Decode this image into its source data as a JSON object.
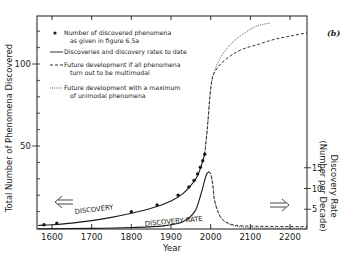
{
  "chart_data": {
    "type": "line",
    "panel_label": "(b)",
    "xlabel": "Year",
    "ylabel_left": "Total Number of Phenomena Discovered",
    "ylabel_right_line1": "Discovery Rate",
    "ylabel_right_line2": "(Number per Decade)",
    "xlim": [
      1565,
      2245
    ],
    "ylim_left": [
      0,
      125
    ],
    "ylim_right": [
      0,
      30
    ],
    "x_ticks": [
      1600,
      1700,
      1800,
      1900,
      2000,
      2100,
      2200
    ],
    "y_left_ticks_labeled": [
      50,
      100
    ],
    "y_left_minor_step": 10,
    "y_right_ticks_labeled": [
      5,
      10,
      15
    ],
    "grid": false,
    "legend_position": "upper-left",
    "legend": [
      {
        "marker": "dot",
        "line1": "Number of discovered phenomena",
        "line2": "as given in figure 6.5a"
      },
      {
        "marker": "solid",
        "line1": "Discoveries and discovery rates to date",
        "line2": ""
      },
      {
        "marker": "dashed",
        "line1": "Future development if all phenomena",
        "line2": "turn out to be multimodal"
      },
      {
        "marker": "dotted",
        "line1": "Future development with a maximum",
        "line2": "of unimodal phenomena"
      }
    ],
    "annotations": [
      {
        "text": "DISCOVERY",
        "x": 1680,
        "y": 10,
        "rotate": -6
      },
      {
        "text": "DISCOVERY RATE",
        "x": 1870,
        "y_rate": 1.2,
        "rotate": -4
      },
      {
        "text": "⇐",
        "x": 1620,
        "y": 17
      },
      {
        "text": "⇒",
        "x": 2160,
        "y_rate": 8
      }
    ],
    "series": [
      {
        "name": "Number of discovered phenomena",
        "style": "points",
        "axis": "left",
        "x": [
          1580,
          1612,
          1800,
          1865,
          1918,
          1945,
          1958,
          1967,
          1974,
          1980,
          1985
        ],
        "y": [
          2,
          3,
          10,
          14,
          20,
          25,
          29,
          33,
          37,
          41,
          45
        ]
      },
      {
        "name": "Discoveries to date (cumulative)",
        "style": "solid",
        "axis": "left",
        "x": [
          1565,
          1600,
          1650,
          1700,
          1750,
          1800,
          1850,
          1900,
          1930,
          1950,
          1965,
          1975,
          1985
        ],
        "y": [
          1.5,
          2,
          3,
          4.5,
          6.5,
          9,
          12,
          16.5,
          21,
          26,
          31,
          37,
          45
        ]
      },
      {
        "name": "Future development if all phenomena turn out to be multimodal",
        "style": "dashed",
        "axis": "left",
        "x": [
          1985,
          1992,
          1998,
          2003,
          2010,
          2025,
          2050,
          2080,
          2120,
          2160,
          2200,
          2245
        ],
        "y": [
          45,
          62,
          80,
          90,
          95,
          100,
          105,
          109,
          112,
          115,
          117,
          119
        ]
      },
      {
        "name": "Future development with a maximum of unimodal phenomena",
        "style": "dotted",
        "axis": "left",
        "x": [
          1985,
          1992,
          1998,
          2003,
          2010,
          2025,
          2050,
          2080,
          2115,
          2150
        ],
        "y": [
          45,
          62,
          80,
          90,
          96,
          104,
          112,
          118,
          123,
          125
        ]
      },
      {
        "name": "Discovery rate to date",
        "style": "solid",
        "axis": "right",
        "x": [
          1565,
          1700,
          1800,
          1880,
          1930,
          1960,
          1975,
          1985,
          1990,
          1995
        ],
        "y": [
          0.3,
          0.4,
          0.6,
          1.0,
          2.0,
          4.5,
          8.5,
          12,
          13.5,
          14
        ]
      },
      {
        "name": "Discovery rate future (dashed)",
        "style": "dashed",
        "axis": "right",
        "x": [
          1995,
          2000,
          2005,
          2010,
          2020,
          2030,
          2045,
          2060,
          2080,
          2120,
          2245
        ],
        "y": [
          14,
          13.5,
          11,
          7,
          4,
          2.5,
          1.6,
          1.2,
          1.0,
          0.9,
          0.8
        ]
      },
      {
        "name": "Discovery rate future (dotted)",
        "style": "dotted",
        "axis": "right",
        "x": [
          1995,
          2000,
          2005,
          2010,
          2020,
          2030,
          2045,
          2060,
          2080,
          2120,
          2245
        ],
        "y": [
          14,
          13.6,
          11.2,
          7.2,
          4.1,
          2.5,
          1.5,
          1.0,
          0.7,
          0.5,
          0.4
        ]
      }
    ]
  }
}
